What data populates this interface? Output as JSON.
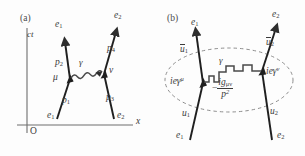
{
  "figure": {
    "type": "feynman-diagrams",
    "background_color": "#fdfdfd",
    "ink_color": "#3a3a3a",
    "panels": [
      {
        "tag": "(a)",
        "description": "Spacetime (Minkowski) representation of electron-electron scattering via one-photon exchange",
        "axes": {
          "vertical_label": "ct",
          "horizontal_label": "x",
          "origin_label": "O"
        },
        "incoming": [
          {
            "particle": "e",
            "index": "1"
          },
          {
            "particle": "e",
            "index": "2"
          }
        ],
        "outgoing": [
          {
            "particle": "e",
            "index": "1"
          },
          {
            "particle": "e",
            "index": "2"
          }
        ],
        "momenta": [
          "p1",
          "p2",
          "p3",
          "p4"
        ],
        "momentum_labels": [
          {
            "sym": "p",
            "idx": "1"
          },
          {
            "sym": "p",
            "idx": "2"
          },
          {
            "sym": "p",
            "idx": "3"
          },
          {
            "sym": "p",
            "idx": "4"
          }
        ],
        "vertices": [
          {
            "label": "mu",
            "glyph": "μ"
          },
          {
            "label": "nu",
            "glyph": "ν"
          }
        ],
        "exchange_boson": {
          "glyph": "γ",
          "name": "photon"
        }
      },
      {
        "tag": "(b)",
        "description": "Feynman rules amplitude factors for the same diagram, enclosed by a dashed ellipse",
        "incoming": [
          {
            "particle": "e",
            "index": "1"
          },
          {
            "particle": "e",
            "index": "2"
          }
        ],
        "outgoing": [
          {
            "particle": "e",
            "index": "1"
          },
          {
            "particle": "e",
            "index": "2"
          }
        ],
        "spinors_in": [
          {
            "sym": "u",
            "idx": "1"
          },
          {
            "sym": "u",
            "idx": "2"
          }
        ],
        "spinors_out": [
          {
            "sym": "u",
            "idx": "1",
            "bar": true
          },
          {
            "sym": "u",
            "idx": "2",
            "bar": true
          }
        ],
        "vertex_factors": [
          {
            "prefix": "ie",
            "gamma": "γ",
            "index": "μ"
          },
          {
            "prefix": "ie",
            "gamma": "γ",
            "index": "ν"
          }
        ],
        "propagator": {
          "sign": "−",
          "numerator_prefix": "ig",
          "numerator_indices": "μν",
          "denominator": "p",
          "denominator_exp": "2"
        },
        "exchange_boson": {
          "glyph": "γ",
          "name": "photon"
        }
      }
    ]
  }
}
